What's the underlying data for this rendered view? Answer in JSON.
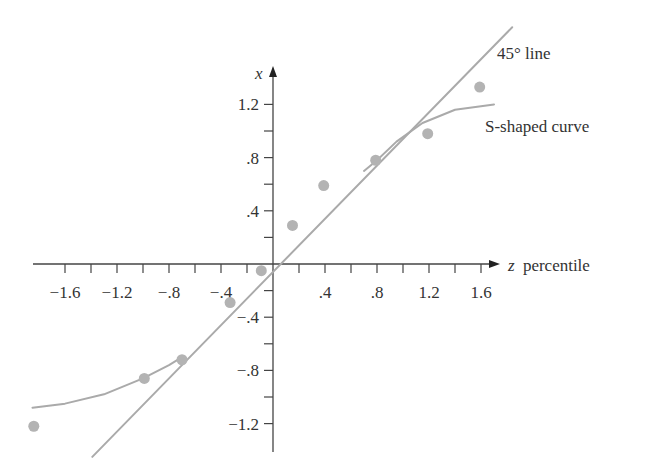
{
  "chart_data": {
    "type": "scatter",
    "title": "",
    "xlabel": "z percentile",
    "xlabel_var": "z",
    "xlabel_rest": "percentile",
    "ylabel": "x",
    "xlim": [
      -1.85,
      1.75
    ],
    "ylim": [
      -1.45,
      1.45
    ],
    "grid": false,
    "legend": null,
    "x_ticks": [
      -1.6,
      -1.4,
      -1.2,
      -1.0,
      -0.8,
      -0.6,
      -0.4,
      -0.2,
      0.2,
      0.4,
      0.6,
      0.8,
      1.0,
      1.2,
      1.4,
      1.6
    ],
    "x_tick_labels": [
      {
        "value": -1.6,
        "label": "−1.6"
      },
      {
        "value": -1.2,
        "label": "−1.2"
      },
      {
        "value": -0.8,
        "label": "−.8"
      },
      {
        "value": -0.4,
        "label": "−.4"
      },
      {
        "value": 0.4,
        "label": ".4"
      },
      {
        "value": 0.8,
        "label": ".8"
      },
      {
        "value": 1.2,
        "label": "1.2"
      },
      {
        "value": 1.6,
        "label": "1.6"
      }
    ],
    "y_ticks": [
      -1.2,
      -1.0,
      -0.8,
      -0.6,
      -0.4,
      -0.2,
      0.2,
      0.4,
      0.6,
      0.8,
      1.0,
      1.2
    ],
    "y_tick_labels": [
      {
        "value": 1.2,
        "label": "1.2"
      },
      {
        "value": 0.8,
        "label": ".8"
      },
      {
        "value": 0.4,
        "label": ".4"
      },
      {
        "value": -0.4,
        "label": "−.4"
      },
      {
        "value": -0.8,
        "label": "−.8"
      },
      {
        "value": -1.2,
        "label": "−1.2"
      }
    ],
    "series": [
      {
        "name": "data points",
        "kind": "scatter",
        "x": [
          -1.84,
          -0.99,
          -0.7,
          -0.33,
          -0.09,
          0.15,
          0.39,
          0.79,
          1.19,
          1.59
        ],
        "y": [
          -1.22,
          -0.86,
          -0.72,
          -0.29,
          -0.05,
          0.29,
          0.59,
          0.78,
          0.98,
          1.33
        ]
      },
      {
        "name": "45° line",
        "kind": "line",
        "x": [
          -1.39,
          1.84
        ],
        "y": [
          -1.45,
          1.78
        ]
      },
      {
        "name": "S-shaped curve",
        "kind": "line",
        "x": [
          -1.85,
          -1.6,
          -1.3,
          -1.0,
          -0.8,
          -0.7,
          0.7,
          0.8,
          0.95,
          1.15,
          1.4,
          1.7
        ],
        "y": [
          -1.08,
          -1.05,
          -0.98,
          -0.86,
          -0.76,
          -0.7,
          0.7,
          0.78,
          0.92,
          1.06,
          1.16,
          1.2
        ]
      }
    ],
    "annotations": [
      {
        "text": "45° line",
        "x": 1.55,
        "y": 1.65
      },
      {
        "text": "S-shaped curve",
        "x": 1.37,
        "y": 0.95
      }
    ],
    "colors": {
      "points": "#b3b3b3",
      "lines": "#aaaaaa",
      "axes": "#444444",
      "text": "#333333"
    }
  }
}
